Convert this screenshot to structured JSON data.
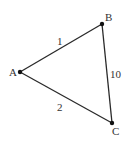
{
  "diagram": {
    "type": "weighted-graph",
    "nodes": [
      {
        "id": "A",
        "label": "A",
        "x": 20,
        "y": 72,
        "label_x": 9,
        "label_y": 76
      },
      {
        "id": "B",
        "label": "B",
        "x": 102,
        "y": 24,
        "label_x": 105,
        "label_y": 21
      },
      {
        "id": "C",
        "label": "C",
        "x": 112,
        "y": 123,
        "label_x": 112,
        "label_y": 135
      }
    ],
    "edges": [
      {
        "from": "A",
        "to": "B",
        "weight": "1",
        "label_x": 57,
        "label_y": 45
      },
      {
        "from": "B",
        "to": "C",
        "weight": "10",
        "label_x": 110,
        "label_y": 78
      },
      {
        "from": "A",
        "to": "C",
        "weight": "2",
        "label_x": 57,
        "label_y": 111
      }
    ],
    "colors": {
      "edge": "#2a2a2a",
      "node": "#111111",
      "label": "#333333",
      "background": "#ffffff"
    }
  }
}
